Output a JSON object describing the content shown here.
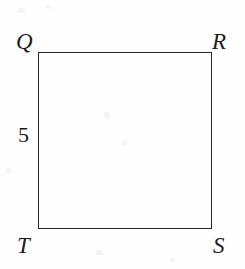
{
  "figure": {
    "kind": "plane-geometry-diagram",
    "shape_name": "square",
    "stroke_color": "#262626",
    "text_color": "#1c1c1c",
    "background_color": "#fefefe",
    "vertices": [
      {
        "id": "Q",
        "label": "Q",
        "position": "top-left"
      },
      {
        "id": "R",
        "label": "R",
        "position": "top-right"
      },
      {
        "id": "S",
        "label": "S",
        "position": "bottom-right"
      },
      {
        "id": "T",
        "label": "T",
        "position": "bottom-left"
      }
    ],
    "side_labels": [
      {
        "id": "QT",
        "label": "5",
        "side": "left",
        "between": "Q-T"
      }
    ]
  }
}
